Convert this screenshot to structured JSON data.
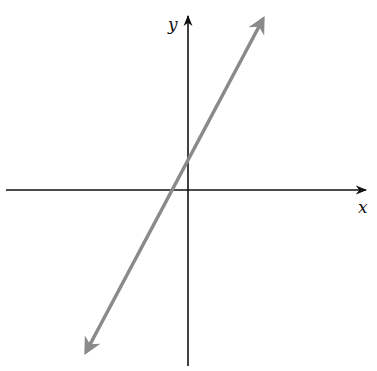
{
  "diagram": {
    "type": "coordinate-plane-line",
    "axes": {
      "x_label": "x",
      "y_label": "y",
      "color": "#111111"
    },
    "line": {
      "color": "#8a8a8a",
      "description": "straight line with positive slope, arrows at both ends, crossing the x-axis slightly left of the origin and the y-axis slightly above the origin"
    }
  }
}
